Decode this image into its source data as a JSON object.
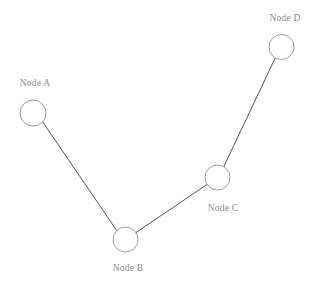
{
  "diagram": {
    "background_color": "#ffffff",
    "width": 318,
    "height": 283,
    "node_fill_color": "#ffffff",
    "node_stroke_color": "#8e8e8e",
    "edge_color": "#3f3f46",
    "label_color": "#8a8a8a",
    "node_radius": 12.5,
    "nodes": [
      {
        "id": "A",
        "label": "Node A",
        "cx": 33,
        "cy": 113,
        "r": 13,
        "label_x": 35,
        "label_y": 86,
        "label_anchor": "middle"
      },
      {
        "id": "B",
        "label": "Node B",
        "cx": 125.5,
        "cy": 239.5,
        "r": 12.5,
        "label_x": 128,
        "label_y": 271,
        "label_anchor": "middle"
      },
      {
        "id": "C",
        "label": "Node C",
        "cx": 217.5,
        "cy": 177.5,
        "r": 12.5,
        "label_x": 223,
        "label_y": 211,
        "label_anchor": "middle"
      },
      {
        "id": "D",
        "label": "Node D",
        "cx": 281.5,
        "cy": 47,
        "r": 12.5,
        "label_x": 285,
        "label_y": 21,
        "label_anchor": "middle"
      }
    ],
    "edges": [
      {
        "id": "A-B",
        "source": "A",
        "target": "B",
        "x1": 42.6,
        "y1": 121.8,
        "x2": 116.8,
        "y2": 230.6
      },
      {
        "id": "B-C",
        "source": "B",
        "target": "C",
        "x1": 136.0,
        "y1": 232.5,
        "x2": 207.0,
        "y2": 184.5
      },
      {
        "id": "C-D",
        "source": "C",
        "target": "D",
        "x1": 223.8,
        "y1": 166.6,
        "x2": 275.2,
        "y2": 58.0
      }
    ]
  }
}
